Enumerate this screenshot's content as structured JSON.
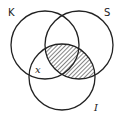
{
  "diagram": {
    "type": "venn",
    "sets": [
      {
        "id": "K",
        "label": "K"
      },
      {
        "id": "S",
        "label": "S"
      },
      {
        "id": "I",
        "label": "I"
      }
    ],
    "shaded_region": [
      "S",
      "I"
    ],
    "shaded_description": "S ∩ I (hatched)",
    "region_labels": [
      {
        "label": "x",
        "region": "K ∩ I only"
      }
    ],
    "colors": {
      "stroke": "#222222",
      "hatch": "#333333",
      "background": "#ffffff"
    }
  }
}
